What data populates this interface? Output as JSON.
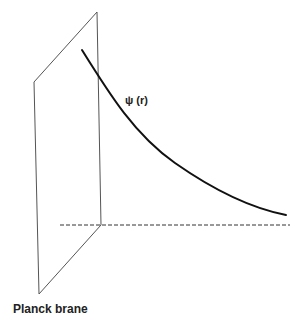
{
  "diagram": {
    "labels": {
      "curve": "ψ (r)",
      "brane": "Planck brane"
    },
    "colors": {
      "background": "#ffffff",
      "brane_edge": "#555555",
      "curve": "#111111",
      "dashed_axis": "#333333",
      "text": "#222222"
    },
    "brane": {
      "points": [
        [
          34,
          82
        ],
        [
          97,
          12
        ],
        [
          101,
          225
        ],
        [
          39,
          294
        ]
      ]
    },
    "curve": {
      "start": [
        82,
        50
      ],
      "end": [
        286,
        215
      ]
    },
    "axis": {
      "start": [
        60,
        225
      ],
      "end": [
        290,
        225
      ],
      "style": "dashed"
    }
  }
}
